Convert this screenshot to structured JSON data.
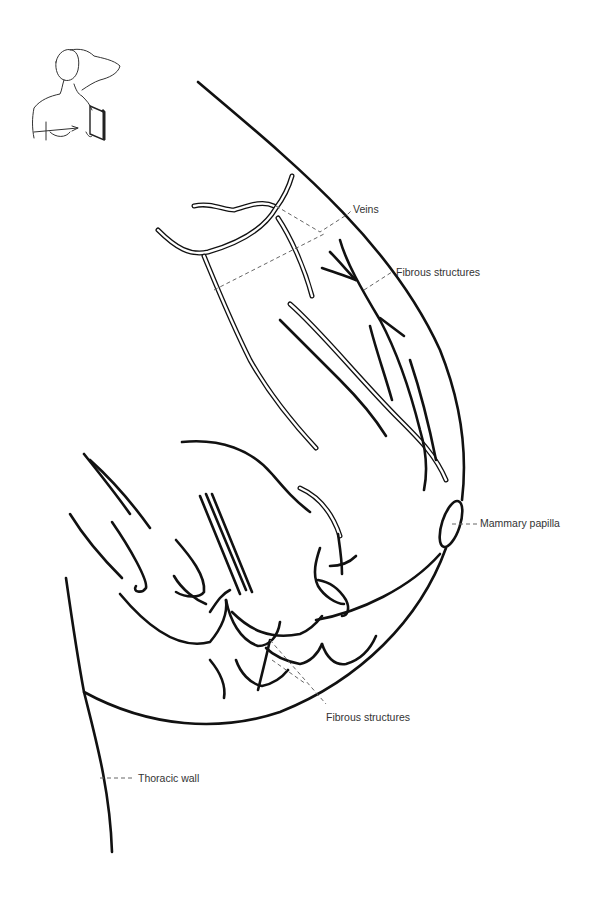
{
  "figure": {
    "kind": "anatomical line drawing",
    "labels": {
      "veins": "Veins",
      "fibrous_upper": "Fibrous structures",
      "mammary_papilla": "Mammary papilla",
      "fibrous_lower": "Fibrous structures",
      "thoracic_wall": "Thoracic wall"
    },
    "orientation_thumbnail": "woman-with-raised-arm-probe-position-icon",
    "colors": {
      "line": "#111111",
      "leader": "#666666",
      "label_text": "#333333",
      "background": "#ffffff"
    }
  }
}
